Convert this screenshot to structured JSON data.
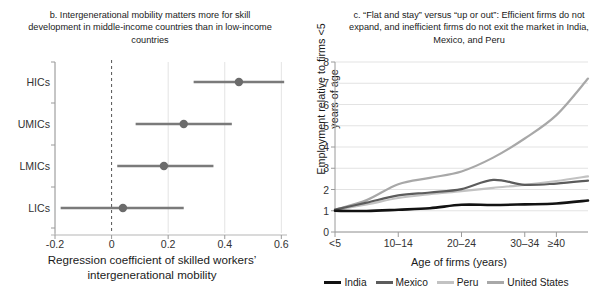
{
  "figure": {
    "panels": [
      {
        "id": "b",
        "title": "b. Intergenerational mobility matters more for skill development in middle-income countries than in low-income countries"
      },
      {
        "id": "c",
        "title": "c. “Flat and stay” versus “up or out”: Efficient firms do not expand, and inefficient firms do not exit the market in India, Mexico, and Peru"
      }
    ]
  },
  "chart_data": [
    {
      "type": "scatter",
      "panel": "b",
      "title": "b. Intergenerational mobility matters more for skill development in middle-income countries than in low-income countries",
      "xlabel": "Regression coefficient of skilled workers’ intergenerational mobility",
      "ylabel": "",
      "xlim": [
        -0.2,
        0.62
      ],
      "ylim": [
        0,
        4
      ],
      "grid": true,
      "grid_axis": "x",
      "reference_line": {
        "x": 0,
        "style": "dashed",
        "color": "#555555"
      },
      "point_color": "#6b6b6b",
      "error_bar_color": "#7a7a7a",
      "xticks": [
        "-0.2",
        "0",
        "0.2",
        "0.4",
        "0.6"
      ],
      "xtick_values": [
        -0.2,
        0,
        0.2,
        0.4,
        0.6
      ],
      "categories": [
        "HICs",
        "UMICs",
        "LMICs",
        "LICs"
      ],
      "values": [
        0.45,
        0.255,
        0.185,
        0.04
      ],
      "ci_low": [
        0.29,
        0.085,
        0.02,
        -0.18
      ],
      "ci_high": [
        0.61,
        0.425,
        0.36,
        0.255
      ],
      "annotations": []
    },
    {
      "type": "line",
      "panel": "c",
      "title": "c. “Flat and stay” versus “up or out”: Efficient firms do not expand, and inefficient firms do not exit the market in India, Mexico, and Peru",
      "xlabel": "Age of firms (years)",
      "ylabel": "Employment relative to firms <5 years of age",
      "xlim": [
        0,
        7
      ],
      "ylim": [
        0,
        8
      ],
      "grid": true,
      "grid_axis": "y",
      "legend_position": "bottom",
      "yticks": [
        "0",
        "1",
        "2",
        "3",
        "4",
        "5",
        "6",
        "7",
        "8"
      ],
      "ytick_values": [
        0,
        1,
        2,
        3,
        4,
        5,
        6,
        7,
        8
      ],
      "xticks": [
        "<5",
        "10–14",
        "20–24",
        "30–34",
        "≥40"
      ],
      "xtick_indices": [
        0,
        2,
        4,
        6,
        7
      ],
      "categories": [
        "<5",
        "5–9",
        "10–14",
        "15–19",
        "20–24",
        "25–29",
        "30–34",
        "35–39",
        "≥40"
      ],
      "series": [
        {
          "name": "India",
          "color": "#121212",
          "values": [
            1.0,
            0.99,
            1.05,
            1.12,
            1.28,
            1.27,
            1.3,
            1.34,
            1.48
          ]
        },
        {
          "name": "Mexico",
          "color": "#5c5c5c",
          "values": [
            1.05,
            1.38,
            1.72,
            1.86,
            2.02,
            2.45,
            2.22,
            2.28,
            2.42
          ]
        },
        {
          "name": "Peru",
          "color": "#c2c2c2",
          "values": [
            1.05,
            1.3,
            1.6,
            1.78,
            1.92,
            2.08,
            2.22,
            2.4,
            2.62
          ]
        },
        {
          "name": "United States",
          "color": "#a8a8a8",
          "values": [
            1.05,
            1.5,
            2.25,
            2.55,
            2.85,
            3.5,
            4.4,
            5.5,
            7.22
          ]
        }
      ]
    }
  ],
  "panel_b": {
    "axis_title": "Regression coefficient of skilled workers’ intergenerational mobility",
    "category_labels": [
      "HICs",
      "UMICs",
      "LMICs",
      "LICs"
    ],
    "xtick_labels": [
      "-0.2",
      "0",
      "0.2",
      "0.4",
      "0.6"
    ]
  },
  "panel_c": {
    "y_axis_title": "Employment relative to firms <5 years of age",
    "x_axis_title": "Age of firms (years)",
    "ytick_labels": [
      "8",
      "7",
      "6",
      "5",
      "4",
      "3",
      "2",
      "1",
      "0"
    ],
    "xtick_labels": [
      "<5",
      "10–14",
      "20–24",
      "30–34",
      "≥40"
    ],
    "legend": [
      {
        "label": "India",
        "color": "#121212"
      },
      {
        "label": "Mexico",
        "color": "#5c5c5c"
      },
      {
        "label": "Peru",
        "color": "#c2c2c2"
      },
      {
        "label": "United States",
        "color": "#a8a8a8"
      }
    ]
  },
  "colors": {
    "background": "#ffffff",
    "text": "#1a1a1a",
    "axis": "#9a9a9a",
    "grid": "#dcdcdc",
    "marker": "#6b6b6b"
  }
}
